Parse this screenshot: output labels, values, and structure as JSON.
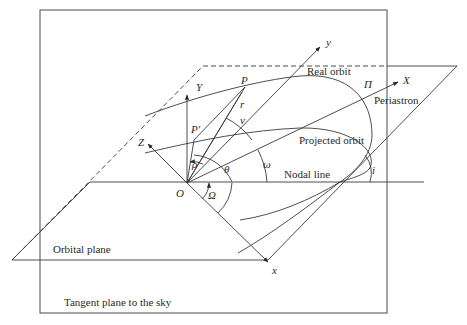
{
  "figure": {
    "planes": {
      "sky_plane": "Tangent plane to the sky",
      "orbital_plane": "Orbital plane"
    },
    "curves": {
      "real_orbit": "Real orbit",
      "projected_orbit": "Projected orbit",
      "nodal_line": "Nodal line",
      "periastron": "Periastron"
    },
    "points": {
      "origin": "O",
      "star": "P",
      "projected_star": "P′",
      "periastron_symbol": "Π"
    },
    "axes": {
      "X": "X",
      "Y": "Y",
      "Z": "Z",
      "x": "x",
      "y": "y"
    },
    "quantities": {
      "radius": "r",
      "projected_radius": "ρ",
      "true_anomaly": "ν",
      "position_angle": "θ",
      "periastron_argument": "ω",
      "node_longitude": "Ω",
      "inclination": "i"
    },
    "colors": {
      "line": "#3a3a3a",
      "background": "#ffffff"
    }
  }
}
